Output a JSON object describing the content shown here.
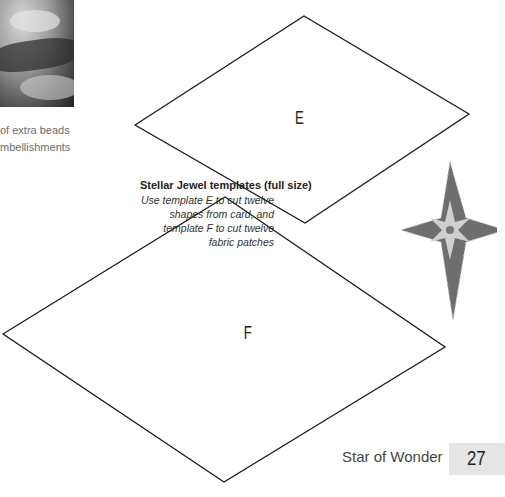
{
  "photo": {
    "alt": "photo of beaded fabric detail"
  },
  "caption": {
    "line1": "of extra beads",
    "line2": "mbellishments"
  },
  "templates": {
    "title": "Stellar Jewel templates (full size)",
    "description": "Use template E to cut twelve shapes from card, and template F to cut twelve fabric patches",
    "items": [
      {
        "label": "E",
        "points": "135,125 304,16 469,114 305,223"
      },
      {
        "label": "F",
        "points": "3,334 225,197 445,347 224,482"
      }
    ]
  },
  "star": {
    "fill": "#6e6e6e",
    "center_fill": "#cfcfcf"
  },
  "footer": {
    "title": "Star of Wonder",
    "page_number": "27"
  }
}
